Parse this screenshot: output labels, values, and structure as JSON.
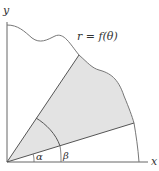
{
  "diagram": {
    "axes": {
      "x_label": "x",
      "y_label": "y"
    },
    "curve_label": "r = f(θ)",
    "angle_labels": {
      "alpha": "α",
      "beta": "β"
    },
    "colors": {
      "shade": "#e3e3e3",
      "line": "#555555",
      "curve": "#777777",
      "text": "#333333"
    }
  }
}
